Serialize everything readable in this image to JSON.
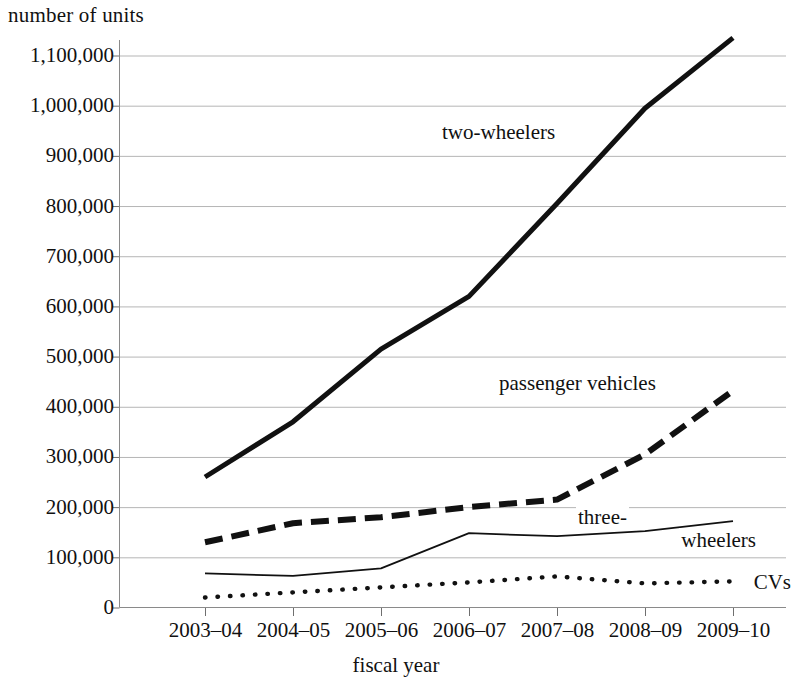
{
  "chart_data": {
    "type": "line",
    "title": "",
    "xlabel": "fiscal year",
    "ylabel": "number of units",
    "categories": [
      "2003–04",
      "2004–05",
      "2005–06",
      "2006–07",
      "2007–08",
      "2008–09",
      "2009–10"
    ],
    "ylim": [
      0,
      1150000
    ],
    "ytick_labels": [
      "1,100,000",
      "1,000,000",
      "900,000",
      "800,000",
      "700,000",
      "600,000",
      "500,000",
      "400,000",
      "300,000",
      "200,000",
      "100,000",
      "0"
    ],
    "ytick_values": [
      1100000,
      1000000,
      900000,
      800000,
      700000,
      600000,
      500000,
      400000,
      300000,
      200000,
      100000,
      0
    ],
    "grid": true,
    "legend_position": "inline-annotations",
    "series": [
      {
        "name": "two-wheelers",
        "style": "solid-thick",
        "values": [
          260000,
          370000,
          515000,
          620000,
          805000,
          995000,
          1135000
        ]
      },
      {
        "name": "passenger vehicles",
        "style": "dashed-thick",
        "values": [
          130000,
          168000,
          180000,
          200000,
          215000,
          305000,
          432000
        ]
      },
      {
        "name": "three-wheelers",
        "style": "solid-thin",
        "values": [
          68000,
          63000,
          78000,
          148000,
          142000,
          152000,
          172000
        ]
      },
      {
        "name": "CVs",
        "style": "dotted",
        "values": [
          20000,
          30000,
          40000,
          50000,
          62000,
          48000,
          52000
        ]
      }
    ],
    "annotations": [
      {
        "text": "two-wheelers",
        "x": 440,
        "y": 120
      },
      {
        "text": "passenger vehicles",
        "x": 497,
        "y": 371
      },
      {
        "text": "three-",
        "x": 576,
        "y": 505
      },
      {
        "text": "wheelers",
        "x": 698,
        "y": 528
      },
      {
        "text": "CVs",
        "x": 733,
        "y": 570
      }
    ]
  }
}
